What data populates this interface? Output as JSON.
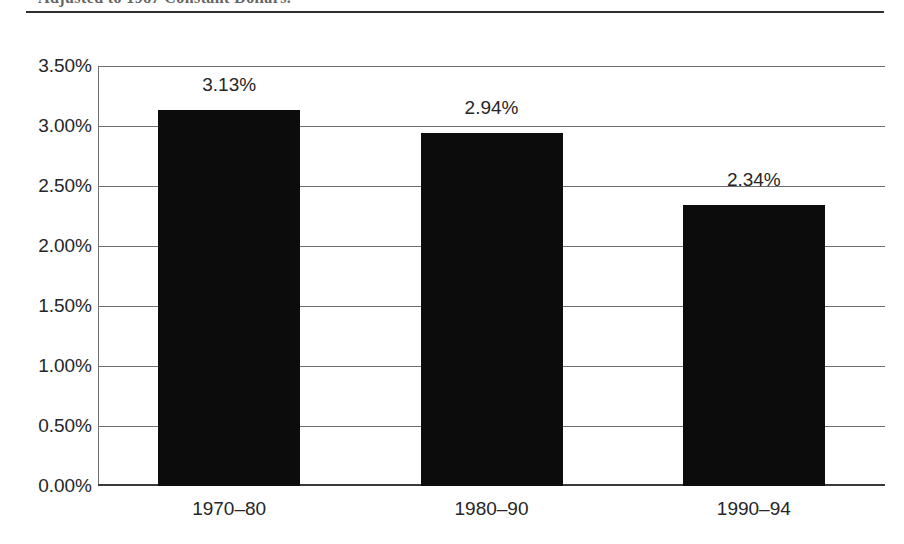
{
  "caption": {
    "text": "Adjusted to 1987 Constant Dollars."
  },
  "chart_data": {
    "type": "bar",
    "title": "",
    "xlabel": "",
    "ylabel": "",
    "categories": [
      "1970–80",
      "1980–90",
      "1990–94"
    ],
    "values": [
      3.13,
      2.94,
      2.34
    ],
    "value_labels": [
      "3.13%",
      "2.94%",
      "2.34%"
    ],
    "ylim": [
      0,
      3.5
    ],
    "ytick_values": [
      0.0,
      0.5,
      1.0,
      1.5,
      2.0,
      2.5,
      3.0,
      3.5
    ],
    "ytick_labels": [
      "0.00%",
      "0.50%",
      "1.00%",
      "1.50%",
      "2.00%",
      "2.50%",
      "3.00%",
      "3.50%"
    ],
    "grid": true,
    "legend": null,
    "bar_color": "#0c0c0c",
    "grid_color": "#6e6e6e",
    "text_color": "#262626"
  }
}
